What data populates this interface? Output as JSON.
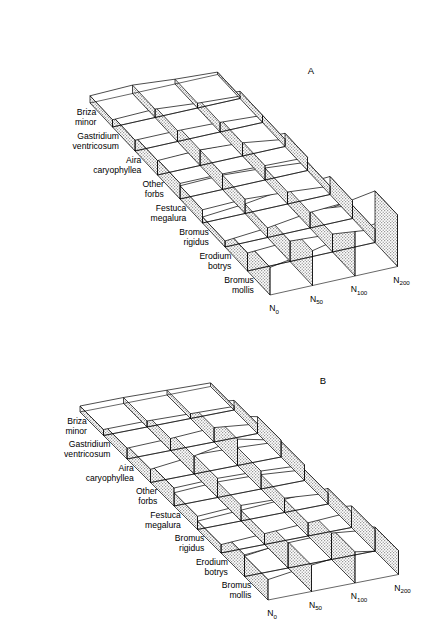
{
  "figure": {
    "type": "scientific-figure",
    "panels": [
      {
        "id": "a",
        "letter": "A"
      },
      {
        "id": "b",
        "letter": "B"
      }
    ]
  },
  "axis": {
    "tick_labels": [
      {
        "base": "N",
        "sub": "0"
      },
      {
        "base": "N",
        "sub": "50"
      },
      {
        "base": "N",
        "sub": "100"
      },
      {
        "base": "N",
        "sub": "200"
      }
    ]
  },
  "species": [
    {
      "id": "bromus-mollis",
      "line1": "Bromus",
      "line2": "mollis"
    },
    {
      "id": "erodium-botrys",
      "line1": "Erodium",
      "line2": "botrys"
    },
    {
      "id": "bromus-rigidus",
      "line1": "Bromus",
      "line2": "rigidus"
    },
    {
      "id": "festuca-megalura",
      "line1": "Festuca",
      "line2": "megalura"
    },
    {
      "id": "other-forbs",
      "line1": "Other",
      "line2": "forbs"
    },
    {
      "id": "aira-caryophyllea",
      "line1": "Aira",
      "line2": "caryophyllea"
    },
    {
      "id": "gastridium-ventricosum",
      "line1": "Gastridium",
      "line2": "ventricosum"
    },
    {
      "id": "briza-minor",
      "line1": "Briza",
      "line2": "minor"
    }
  ],
  "chart_data": {
    "type": "area",
    "title": "",
    "xlabel": "",
    "ylabel": "",
    "categories": [
      "N0",
      "N50",
      "N100",
      "N200"
    ],
    "category_labels": [
      "N₀",
      "N₅₀",
      "N₁₀₀",
      "N₂₀₀"
    ],
    "grid": false,
    "legend": "none",
    "ylim": [
      0,
      100
    ],
    "panels": [
      {
        "letter": "A",
        "series": [
          {
            "name": "Bromus mollis",
            "values": [
              46,
              58,
              74,
              86
            ]
          },
          {
            "name": "Erodium botrys",
            "values": [
              30,
              34,
              30,
              22
            ]
          },
          {
            "name": "Bromus rigidus",
            "values": [
              10,
              16,
              26,
              30
            ]
          },
          {
            "name": "Festuca megalura",
            "values": [
              22,
              24,
              20,
              14
            ]
          },
          {
            "name": "Other forbs",
            "values": [
              26,
              26,
              24,
              22
            ]
          },
          {
            "name": "Aira caryophyllea",
            "values": [
              24,
              26,
              22,
              12
            ]
          },
          {
            "name": "Gastridium ventricosum",
            "values": [
              18,
              18,
              16,
              12
            ]
          },
          {
            "name": "Briza minor",
            "values": [
              12,
              14,
              8,
              4
            ]
          }
        ]
      },
      {
        "letter": "B",
        "series": [
          {
            "name": "Bromus mollis",
            "values": [
              34,
              44,
              52,
              40
            ]
          },
          {
            "name": "Erodium botrys",
            "values": [
              36,
              42,
              44,
              36
            ]
          },
          {
            "name": "Bromus rigidus",
            "values": [
              14,
              18,
              22,
              26
            ]
          },
          {
            "name": "Festuca megalura",
            "values": [
              22,
              26,
              24,
              18
            ]
          },
          {
            "name": "Other forbs",
            "values": [
              30,
              32,
              30,
              26
            ]
          },
          {
            "name": "Aira caryophyllea",
            "values": [
              22,
              30,
              44,
              28
            ]
          },
          {
            "name": "Gastridium ventricosum",
            "values": [
              18,
              20,
              24,
              16
            ]
          },
          {
            "name": "Briza minor",
            "values": [
              10,
              10,
              8,
              6
            ]
          }
        ]
      }
    ]
  },
  "colors": {
    "stroke": "#000000",
    "band_top_fill": "#ffffff",
    "band_side_stipple": "#d9d9d9",
    "background": "#ffffff"
  }
}
